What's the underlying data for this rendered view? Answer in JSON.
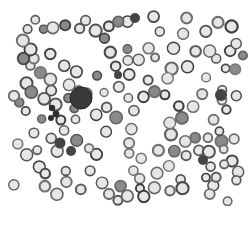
{
  "image": {
    "subject": "Peripheral blood smear micrograph (grayscale)",
    "description": "Numerous red blood cells shown as dark-rimmed rings with pale centers, a large lobulated dark leukocyte, a small segmented neutrophil-like cell and several dark dense cells scattered across a white background.",
    "colors": {
      "background": "#ffffff",
      "cell_rim": "#5a5a5a",
      "cell_center": "#e6e6e6",
      "leukocyte": "#3a3a3a",
      "dark_cell": "#444444"
    },
    "visible_cell_types": [
      "red blood cell",
      "leukocyte",
      "segmented neutrophil",
      "dense dark cell",
      "platelet"
    ]
  }
}
